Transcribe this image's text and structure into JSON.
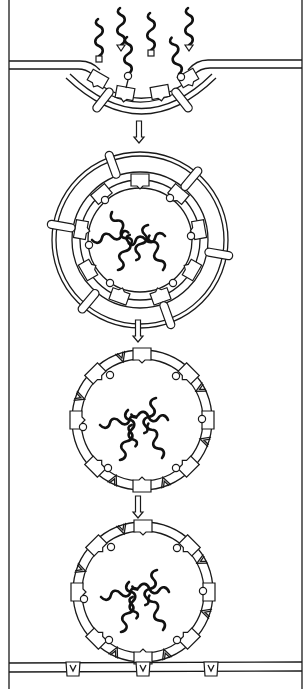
{
  "figure": {
    "description": "Schematic of vesicle budding from a donor membrane, uncoating, and docking/fusion at a target membrane carrying V-shaped receptors",
    "stages": [
      {
        "id": "budding",
        "label": "Cargo with tags binding receptors at coated pit"
      },
      {
        "id": "coated-vesicle",
        "label": "Coated vesicle with cargo"
      },
      {
        "id": "uncoated-vesicle",
        "label": "Uncoated vesicle with v-type markers"
      },
      {
        "id": "docking",
        "label": "Vesicle docking at target membrane"
      }
    ],
    "arrows": 3,
    "colors": {
      "line": "#1a1a1a",
      "background": "#ffffff"
    }
  }
}
